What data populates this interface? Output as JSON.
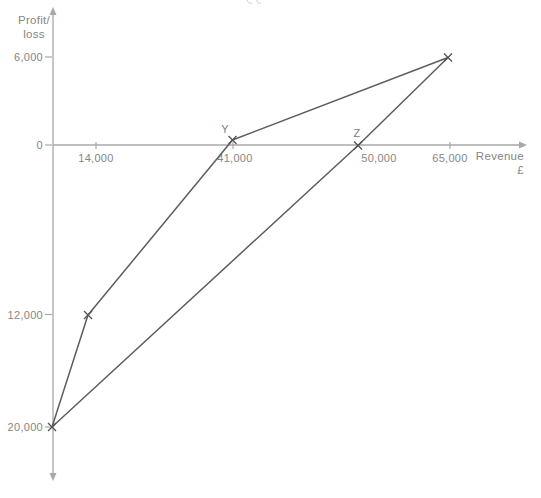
{
  "colors": {
    "background": "#ffffff",
    "axis": "#a8a8a8",
    "series_line": "#5d5d5d",
    "marker": "#525252",
    "text": "#868686",
    "fragment": "#cccccc"
  },
  "labels": {
    "y_axis_line1": "Profit/",
    "y_axis_line2": "loss",
    "x_axis_line1": "Revenue",
    "x_axis_line2": "£"
  },
  "chart_data": {
    "type": "line",
    "title": "",
    "xlabel": "Revenue £",
    "ylabel": "Profit/loss",
    "grid": false,
    "legend": "none",
    "axes_not_to_scale": true,
    "xlim": [
      0,
      70000
    ],
    "ylim": [
      -24000,
      9000
    ],
    "x_tick_values": [
      14000,
      41000,
      50000,
      65000
    ],
    "x_tick_labels": [
      "14,000",
      "41,000",
      "50,000",
      "65,000"
    ],
    "y_tick_values": [
      6000,
      0,
      -12000,
      -20000
    ],
    "y_tick_labels": [
      "6,000",
      "0",
      "12,000",
      "20,000"
    ],
    "series": [
      {
        "name": "cumulative-product-profit-line",
        "points": [
          [
            0,
            -20000
          ],
          [
            14000,
            -12000
          ],
          [
            41000,
            0
          ],
          [
            65000,
            6000
          ]
        ]
      },
      {
        "name": "average-profit-line",
        "points": [
          [
            0,
            -20000
          ],
          [
            50000,
            0
          ],
          [
            65000,
            6000
          ]
        ]
      }
    ],
    "marker_style": "x",
    "marker_points": [
      [
        0,
        -20000
      ],
      [
        14000,
        -12000
      ],
      [
        41000,
        0
      ],
      [
        50000,
        0
      ],
      [
        65000,
        6000
      ]
    ],
    "annotations": [
      {
        "label": "Y",
        "x": 41000,
        "y": 0
      },
      {
        "label": "Z",
        "x": 50000,
        "y": 0
      }
    ]
  },
  "render": {
    "width": 541,
    "height": 498,
    "axis": {
      "x": 53,
      "y": 145,
      "y_top": 14,
      "y_bottom": 474,
      "x_right": 520
    },
    "x_ticks": [
      {
        "px": 96,
        "label_x": 96,
        "label_index": 0,
        "tick": true
      },
      {
        "px": 233,
        "label_x": 235,
        "label_index": 1,
        "tick": true
      },
      {
        "px": 358,
        "label_x": 379,
        "label_index": 2,
        "tick": false
      },
      {
        "px": 450,
        "label_x": 450,
        "label_index": 3,
        "tick": true
      }
    ],
    "y_ticks": [
      {
        "py": 57,
        "label_index": 0
      },
      {
        "py": 145,
        "label_index": 1
      },
      {
        "py": 314.5,
        "label_index": 2
      },
      {
        "py": 427,
        "label_index": 3
      }
    ],
    "series_px": [
      [
        [
          52,
          427
        ],
        [
          88,
          315
        ],
        [
          232.5,
          140
        ],
        [
          448,
          57.5
        ]
      ],
      [
        [
          52,
          427
        ],
        [
          358,
          145.5
        ],
        [
          448,
          57.5
        ]
      ]
    ],
    "markers_px": [
      [
        52,
        427
      ],
      [
        88,
        315
      ],
      [
        232.5,
        140
      ],
      [
        358,
        145.5
      ],
      [
        448,
        57.5
      ]
    ],
    "annotations_px": [
      {
        "x": 225,
        "y": 133,
        "label_index": 0
      },
      {
        "x": 357,
        "y": 137,
        "label_index": 1
      }
    ],
    "y_title_px": {
      "x": 34,
      "y1": 24,
      "y2": 38
    },
    "x_title_px": {
      "x": 524,
      "y1": 160,
      "y2": 174
    }
  }
}
